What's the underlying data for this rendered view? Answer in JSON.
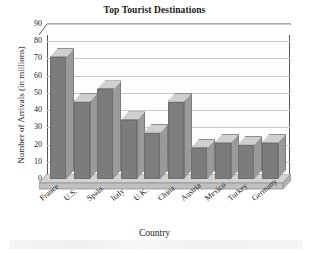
{
  "chart_data": {
    "type": "bar",
    "title": "Top Tourist Destinations",
    "xlabel": "Country",
    "ylabel": "Number of Arrivals (in millions)",
    "categories": [
      "France",
      "U.S.",
      "Spain",
      "Italy",
      "U.K.",
      "China",
      "Austria",
      "Mexico",
      "Turkey",
      "Germany"
    ],
    "values": [
      75,
      49,
      56,
      38,
      31,
      49,
      22,
      25,
      24,
      25
    ],
    "front_face_values": [
      71,
      45,
      52,
      34,
      27,
      45,
      18,
      21,
      20,
      21
    ],
    "ylim": [
      0,
      90
    ],
    "yticks": [
      0,
      10,
      20,
      30,
      40,
      50,
      60,
      70,
      80,
      90
    ],
    "ytick_labels": [
      "0",
      "10",
      "20",
      "30",
      "40",
      "50",
      "60",
      "70",
      "80",
      "90"
    ],
    "grid": true,
    "legend": false,
    "style": "3d-bar",
    "colors": {
      "bar_front": "#7c7c7c",
      "bar_top": "#cfcfcf",
      "bar_side": "#9a9a9a",
      "floor": "#c6c6c6",
      "gridline": "#c9c9c9",
      "axis": "#585858",
      "plot_background": "#fefefe",
      "text": "#1a1a1a"
    }
  }
}
